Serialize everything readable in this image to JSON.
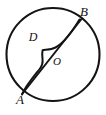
{
  "figure": {
    "type": "geometry-diagram",
    "background_color": "#ffffff",
    "stroke_color": "#141414",
    "labels": {
      "a": "A",
      "b": "B",
      "d": "D",
      "o": "O"
    },
    "label_positions": {
      "a": {
        "x": 20,
        "y": 104
      },
      "b": {
        "x": 84,
        "y": 16
      },
      "d": {
        "x": 33,
        "y": 41
      },
      "o": {
        "x": 57,
        "y": 65
      }
    },
    "circle": {
      "cx": 53,
      "cy": 54.5,
      "r": 46.5,
      "stroke_width": 2.1
    },
    "chord": {
      "from": "A",
      "to": "B",
      "x1": 22.5,
      "y1": 93.5,
      "x2": 81.5,
      "y2": 19.0,
      "stroke_width": 2.0
    },
    "curve": {
      "name": "wavy-arc-AB",
      "path": "M 22.0 94.5 C 25.5 86.0 34.5 75.5 40.0 68.5 C 42.6 65.2 43.0 63.0 42.5 58.5 C 42.2 55.8 42.2 52.0 42.6 50.3 C 44.6 49.6 50.5 50.2 55.5 47.5 C 63.5 43.2 72.0 32.0 79.5 19.5",
      "stroke_width": 2.0
    }
  }
}
